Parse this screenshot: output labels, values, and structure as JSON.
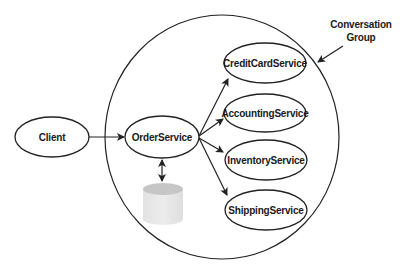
{
  "diagram": {
    "type": "service-conversation-group",
    "group_label_line1": "Conversation",
    "group_label_line2": "Group",
    "nodes": {
      "client": "Client",
      "order": "OrderService",
      "credit": "CreditCardService",
      "accounting": "AccountingService",
      "inventory": "InventoryService",
      "shipping": "ShippingService"
    },
    "database_icon": "database-cylinder",
    "edges": [
      {
        "from": "Client",
        "to": "OrderService",
        "direction": "one-way"
      },
      {
        "from": "OrderService",
        "to": "CreditCardService",
        "direction": "one-way"
      },
      {
        "from": "OrderService",
        "to": "AccountingService",
        "direction": "one-way"
      },
      {
        "from": "OrderService",
        "to": "InventoryService",
        "direction": "one-way"
      },
      {
        "from": "OrderService",
        "to": "ShippingService",
        "direction": "one-way"
      },
      {
        "from": "OrderService",
        "to": "Database",
        "direction": "two-way"
      }
    ],
    "colors": {
      "stroke": "#222222",
      "background": "#ffffff",
      "db_top": "#c8c8c8",
      "db_body": "#e6e6e6"
    }
  }
}
